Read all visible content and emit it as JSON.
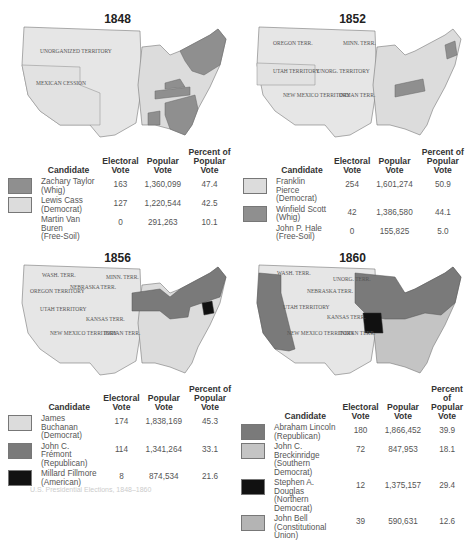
{
  "figure": {
    "caption": "U.S. Presidential Elections, 1848–1860"
  },
  "colors": {
    "whig": "#8f8f8f",
    "democrat_light": "#dcdcdc",
    "republican": "#7a7a7a",
    "american_black": "#111111",
    "breckinridge": "#c4c4c4",
    "douglas_black": "#111111",
    "bell": "#b4b4b4",
    "territory": "#e6e6e6",
    "border": "#777777"
  },
  "table_headers": {
    "candidate": "Candidate",
    "electoral_1": "Electoral",
    "electoral_2": "Vote",
    "popular_1": "Popular",
    "popular_2": "Vote",
    "percent_1": "Percent of",
    "percent_2": "Popular Vote"
  },
  "elections": [
    {
      "year": "1848",
      "map_labels": [
        "UNORGANIZED TERRITORY",
        "MEXICAN CESSION"
      ],
      "candidates": [
        {
          "name": "Zachary Taylor",
          "party": "(Whig)",
          "electoral": "163",
          "popular": "1,360,099",
          "percent": "47.4",
          "swatch": "#8f8f8f"
        },
        {
          "name": "Lewis Cass",
          "party": "(Democrat)",
          "electoral": "127",
          "popular": "1,220,544",
          "percent": "42.5",
          "swatch": "#dcdcdc"
        },
        {
          "name": "Martin Van Buren",
          "party": "(Free-Soil)",
          "electoral": "0",
          "popular": "291,263",
          "percent": "10.1",
          "swatch": null
        }
      ]
    },
    {
      "year": "1852",
      "map_labels": [
        "OREGON TERR.",
        "MINN. TERR.",
        "UTAH TERRITORY",
        "UNORG. TERRITORY",
        "NEW MEXICO TERRITORY",
        "INDIAN TERR."
      ],
      "candidates": [
        {
          "name": "Franklin Pierce",
          "party": "(Democrat)",
          "electoral": "254",
          "popular": "1,601,274",
          "percent": "50.9",
          "swatch": "#dcdcdc"
        },
        {
          "name": "Winfield Scott",
          "party": "(Whig)",
          "electoral": "42",
          "popular": "1,386,580",
          "percent": "44.1",
          "swatch": "#8f8f8f"
        },
        {
          "name": "John P. Hale",
          "party": "(Free-Soil)",
          "electoral": "0",
          "popular": "155,825",
          "percent": "5.0",
          "swatch": null
        }
      ]
    },
    {
      "year": "1856",
      "map_labels": [
        "WASH. TERR.",
        "OREGON TERRITORY",
        "MINN. TERR.",
        "NEBRASKA TERR.",
        "UTAH TERRITORY",
        "KANSAS TERR.",
        "NEW MEXICO TERRITORY",
        "INDIAN TERR."
      ],
      "candidates": [
        {
          "name": "James Buchanan",
          "party": "(Democrat)",
          "electoral": "174",
          "popular": "1,838,169",
          "percent": "45.3",
          "swatch": "#dcdcdc"
        },
        {
          "name": "John C. Frémont",
          "party": "(Republican)",
          "electoral": "114",
          "popular": "1,341,264",
          "percent": "33.1",
          "swatch": "#7a7a7a"
        },
        {
          "name": "Millard Fillmore",
          "party": "(American)",
          "electoral": "8",
          "popular": "874,534",
          "percent": "21.6",
          "swatch": "#111111"
        }
      ]
    },
    {
      "year": "1860",
      "map_labels": [
        "WASH. TERR.",
        "UNORG. TERR.",
        "NEBRASKA TERR.",
        "UTAH TERRITORY",
        "KANSAS TERR.",
        "NEW MEXICO TERRITORY",
        "INDIAN TERR."
      ],
      "candidates": [
        {
          "name": "Abraham Lincoln",
          "party": "(Republican)",
          "electoral": "180",
          "popular": "1,866,452",
          "percent": "39.9",
          "swatch": "#7a7a7a"
        },
        {
          "name": "John C. Breckinridge",
          "party": "(Southern Democrat)",
          "electoral": "72",
          "popular": "847,953",
          "percent": "18.1",
          "swatch": "#c4c4c4"
        },
        {
          "name": "Stephen A. Douglas",
          "party": "(Northern Democrat)",
          "electoral": "12",
          "popular": "1,375,157",
          "percent": "29.4",
          "swatch": "#111111"
        },
        {
          "name": "John Bell",
          "party": "(Constitutional Union)",
          "electoral": "39",
          "popular": "590,631",
          "percent": "12.6",
          "swatch": "#b4b4b4"
        }
      ]
    }
  ]
}
